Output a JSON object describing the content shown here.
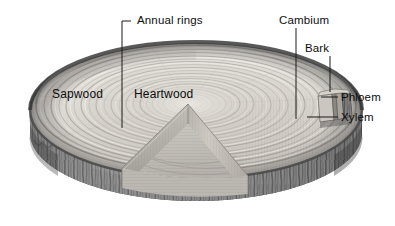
{
  "figure": {
    "background_color": "#ffffff",
    "ink_color": "#0d0d0d",
    "style": "grayscale pen-and-ink botanical illustration"
  },
  "labels": {
    "annual_rings": "Annual rings",
    "cambium": "Cambium",
    "bark": "Bark",
    "phloem": "Phloem",
    "xylem": "Xylem",
    "sapwood": "Sapwood",
    "heartwood": "Heartwood"
  },
  "palette": {
    "bark_dark": "#4a4a4a",
    "bark_mid": "#7d7d7d",
    "bark_light": "#b0b0b0",
    "wood_light": "#e9e7e2",
    "wood_mid": "#cfcbc3",
    "wood_shadow": "#a9a5a0",
    "rim_dark": "#3f3f3f",
    "leader_line": "#1a1a1a"
  },
  "annotations": [
    {
      "name": "annual-rings",
      "label": "Annual rings",
      "leader": "bracket-down",
      "target": "ring pattern on top face"
    },
    {
      "name": "cambium",
      "label": "Cambium",
      "leader": "vertical-down",
      "target": "thin growth layer under bark"
    },
    {
      "name": "bark",
      "label": "Bark",
      "leader": "vertical-down",
      "target": "outer protective layer"
    },
    {
      "name": "phloem",
      "label": "Phloem",
      "leader": "horizontal-left",
      "target": "inner bark step"
    },
    {
      "name": "xylem",
      "label": "Xylem",
      "leader": "horizontal-left",
      "target": "wood step"
    },
    {
      "name": "sapwood",
      "label": "Sapwood",
      "leader": "none",
      "target": "outer pale wood band"
    },
    {
      "name": "heartwood",
      "label": "Heartwood",
      "leader": "none",
      "target": "central darker core"
    }
  ]
}
